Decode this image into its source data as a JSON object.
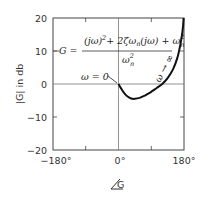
{
  "chart_data": {
    "type": "line",
    "title": "",
    "xlabel": "∠G",
    "ylabel": "|G| in db",
    "xlim": [
      -180,
      180
    ],
    "ylim": [
      -20,
      20
    ],
    "x_ticks": [
      -180,
      -90,
      0,
      90,
      180
    ],
    "x_tick_labels": [
      "-180°",
      "",
      "0°",
      "",
      "180°"
    ],
    "y_ticks": [
      -20,
      -10,
      0,
      10,
      20
    ],
    "y_tick_labels": [
      "-20",
      "-10",
      "0",
      "10",
      "20"
    ],
    "grid": "center lines at 0° and 0 dB",
    "legend": null,
    "equation": {
      "lhs": "G =",
      "numerator": "(jω)² + 2ζωn(jω) + ωn²",
      "denominator": "ωn²"
    },
    "annotations": [
      {
        "text": "ω = 0",
        "points_to": [
          0,
          0
        ]
      },
      {
        "text": "ω → ∞",
        "points_to": [
          175,
          12
        ]
      }
    ],
    "series": [
      {
        "name": "G(jω) Nichols locus",
        "x": [
          0,
          8,
          16,
          25,
          35,
          45,
          58,
          72,
          88,
          105,
          120,
          135,
          150,
          162,
          170,
          176,
          179
        ],
        "y": [
          0,
          -1.5,
          -2.8,
          -3.8,
          -4.4,
          -4.5,
          -4.2,
          -3.5,
          -2.5,
          -1.2,
          0,
          1.8,
          4.5,
          8,
          12,
          16,
          20
        ]
      }
    ]
  },
  "labels": {
    "y_axis": "|G| in db",
    "x_axis_symbol": "G",
    "eq_lhs": "G =",
    "eq_numerator_part1": "(jω)",
    "eq_numerator_sup1": "2",
    "eq_numerator_part2": "+ 2ζω",
    "eq_numerator_sub1": "n",
    "eq_numerator_part3": "(jω) + ω",
    "eq_numerator_sup2": "2",
    "eq_numerator_sub2": "n",
    "eq_denominator": "ω",
    "eq_denominator_sup": "2",
    "eq_denominator_sub": "n",
    "ann_w0": "ω = 0",
    "ann_winf": "ω → ∞"
  },
  "ticks": {
    "y20": "20",
    "y10": "10",
    "y0": "0",
    "ym10": "−10",
    "ym20": "−20",
    "xm180": "−180°",
    "x0": "0°",
    "x180": "180°"
  }
}
